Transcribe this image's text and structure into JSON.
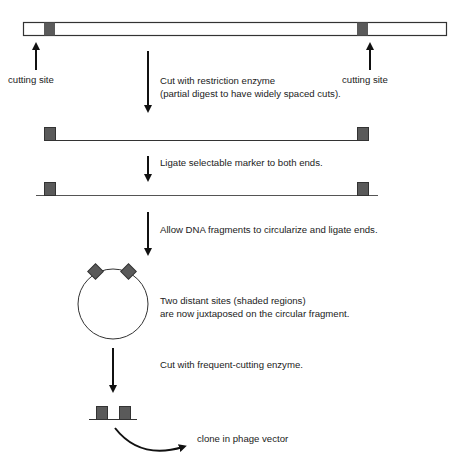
{
  "diagram": {
    "colors": {
      "stroke": "#222222",
      "shade": "#555555",
      "background": "#ffffff"
    },
    "top_labels": {
      "left_cutting_site": "cutting site",
      "right_cutting_site": "cutting site"
    },
    "steps": [
      {
        "id": "step1",
        "line1": "Cut with restriction enzyme",
        "line2": "(partial digest to have widely spaced cuts)."
      },
      {
        "id": "step2",
        "line1": "Ligate selectable marker to both ends."
      },
      {
        "id": "step3",
        "line1": "Allow DNA fragments to circularize and ligate ends."
      },
      {
        "id": "step4",
        "line1": "Two distant sites (shaded regions)",
        "line2": "are now juxtaposed on the circular fragment."
      },
      {
        "id": "step5",
        "line1": "Cut with frequent-cutting enzyme."
      },
      {
        "id": "step6",
        "line1": "clone in phage vector"
      }
    ]
  }
}
